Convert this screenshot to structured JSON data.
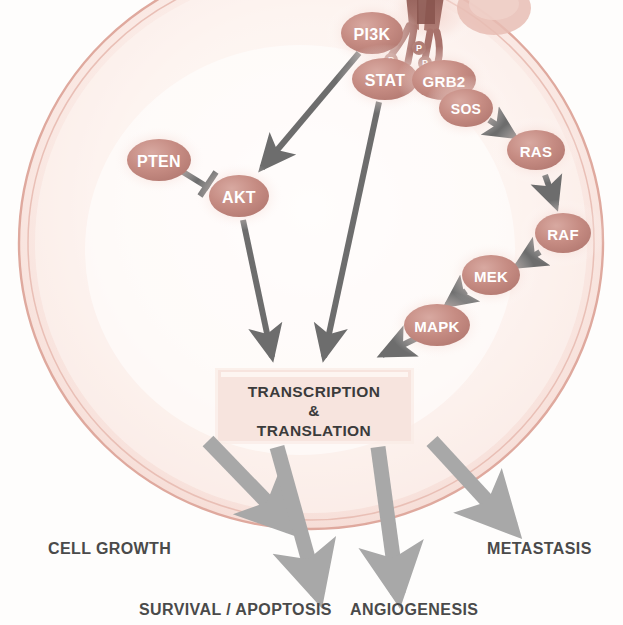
{
  "diagram": {
    "colors": {
      "membrane_stroke": "#d9a89e",
      "membrane_fill": "#f6ded8",
      "cytoplasm": "#fdf3f0",
      "node_fill": "#c79189",
      "node_text": "#ffffff",
      "arrow_gray": "#6d6d6d",
      "outcome_arrow": "#a8a8a8",
      "box_fill": "#f7e6e1",
      "box_text": "#3b3b3b",
      "receptor_dark": "#9e6a63"
    }
  },
  "cell": {
    "membrane_label": "cell-membrane",
    "cytoplasm_label": "cytoplasm"
  },
  "receptor": {
    "name": "receptor-tyrosine-kinase",
    "phosphate_marks": [
      "P",
      "P",
      "P",
      "P"
    ],
    "ligand_label": "ligand"
  },
  "nodes": [
    {
      "id": "pi3k",
      "label": "PI3K",
      "cx": 372,
      "cy": 33,
      "rx": 31,
      "ry": 21,
      "font": 16
    },
    {
      "id": "stat",
      "label": "STAT",
      "cx": 385,
      "cy": 79,
      "rx": 33,
      "ry": 21,
      "font": 16
    },
    {
      "id": "grb2",
      "label": "GRB2",
      "cx": 444,
      "cy": 80,
      "rx": 32,
      "ry": 20,
      "font": 15
    },
    {
      "id": "sos",
      "label": "SOS",
      "cx": 466,
      "cy": 108,
      "rx": 27,
      "ry": 19,
      "font": 14
    },
    {
      "id": "ras",
      "label": "RAS",
      "cx": 536,
      "cy": 150,
      "rx": 29,
      "ry": 20,
      "font": 15
    },
    {
      "id": "raf",
      "label": "RAF",
      "cx": 563,
      "cy": 233,
      "rx": 28,
      "ry": 20,
      "font": 15
    },
    {
      "id": "mek",
      "label": "MEK",
      "cx": 491,
      "cy": 275,
      "rx": 29,
      "ry": 20,
      "font": 15
    },
    {
      "id": "mapk",
      "label": "MAPK",
      "cx": 437,
      "cy": 325,
      "rx": 33,
      "ry": 21,
      "font": 15
    },
    {
      "id": "pten",
      "label": "PTEN",
      "cx": 159,
      "cy": 160,
      "rx": 32,
      "ry": 21,
      "font": 16
    },
    {
      "id": "akt",
      "label": "AKT",
      "cx": 239,
      "cy": 196,
      "rx": 30,
      "ry": 21,
      "font": 16
    }
  ],
  "edges": [
    {
      "from": "sos",
      "to": "ras",
      "type": "activation"
    },
    {
      "from": "ras",
      "to": "raf",
      "type": "activation"
    },
    {
      "from": "raf",
      "to": "mek",
      "type": "activation"
    },
    {
      "from": "mek",
      "to": "mapk",
      "type": "activation"
    },
    {
      "from": "pten",
      "to": "akt",
      "type": "inhibition"
    },
    {
      "from": "pi3k",
      "to": "akt",
      "type": "activation"
    },
    {
      "from": "akt",
      "to": "transcription_box",
      "type": "activation"
    },
    {
      "from": "stat",
      "to": "transcription_box",
      "type": "activation"
    },
    {
      "from": "mapk",
      "to": "transcription_box",
      "type": "activation"
    }
  ],
  "transcription_box": {
    "line1": "TRANSCRIPTION",
    "line2": "&",
    "line3": "TRANSLATION"
  },
  "outcomes": [
    {
      "id": "cell-growth",
      "label": "CELL GROWTH",
      "text_x": 48,
      "text_y": 548,
      "anchor": "start"
    },
    {
      "id": "survival-apoptosis",
      "label": "SURVIVAL / APOPTOSIS",
      "text_x": 139,
      "text_y": 609,
      "anchor": "start"
    },
    {
      "id": "angiogenesis",
      "label": "ANGIOGENESIS",
      "text_x": 350,
      "text_y": 609,
      "anchor": "start"
    },
    {
      "id": "metastasis",
      "label": "METASTASIS",
      "text_x": 487,
      "text_y": 548,
      "anchor": "start"
    }
  ]
}
